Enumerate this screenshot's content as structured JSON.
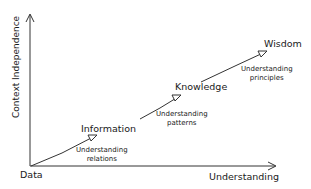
{
  "diagram": {
    "type": "DIKW hierarchy",
    "axes": {
      "x_label": "Understanding",
      "y_label": "Context Independence"
    },
    "nodes": [
      {
        "id": "data",
        "label": "Data"
      },
      {
        "id": "information",
        "label": "Information"
      },
      {
        "id": "knowledge",
        "label": "Knowledge"
      },
      {
        "id": "wisdom",
        "label": "Wisdom"
      }
    ],
    "transitions": [
      {
        "from": "data",
        "to": "information",
        "line1": "Understanding",
        "line2": "relations"
      },
      {
        "from": "information",
        "to": "knowledge",
        "line1": "Understanding",
        "line2": "patterns"
      },
      {
        "from": "knowledge",
        "to": "wisdom",
        "line1": "Understanding",
        "line2": "principles"
      }
    ],
    "colors": {
      "line": "#333333",
      "text": "#1a1a1a",
      "background": "#ffffff"
    }
  }
}
